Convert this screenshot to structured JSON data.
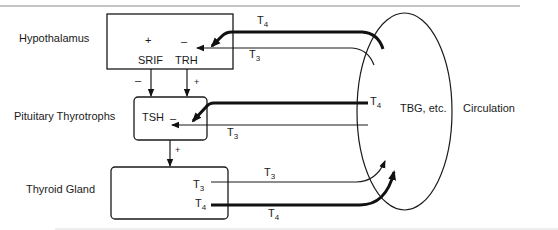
{
  "diagram": {
    "title_clipped": "",
    "colors": {
      "ink": "#1a1a1a",
      "background": "#ffffff",
      "rule": "#8a8a8a"
    },
    "organs": {
      "hypothalamus": {
        "label": "Hypothalamus",
        "plus": "+",
        "minus": "–",
        "srif": "SRIF",
        "trh": "TRH"
      },
      "pituitary": {
        "label": "Pituitary Thyrotrophs",
        "hormone": "TSH",
        "minus": "–"
      },
      "thyroid": {
        "label": "Thyroid Gland",
        "t3": "T",
        "t3_sub": "3",
        "t4": "T",
        "t4_sub": "4"
      }
    },
    "edges": {
      "srif_sign": "–",
      "trh_sign": "+",
      "tsh_sign": "+"
    },
    "circulation": {
      "inner_label": "TBG, etc.",
      "outer_label": "Circulation"
    },
    "feedback": {
      "hypo_t4": {
        "base": "T",
        "sub": "4"
      },
      "hypo_t3": {
        "base": "T",
        "sub": "3"
      },
      "pit_t4": {
        "base": "T",
        "sub": "4"
      },
      "pit_t3": {
        "base": "T",
        "sub": "3"
      },
      "out_t3": {
        "base": "T",
        "sub": "3"
      },
      "out_t4": {
        "base": "T",
        "sub": "4"
      }
    }
  }
}
